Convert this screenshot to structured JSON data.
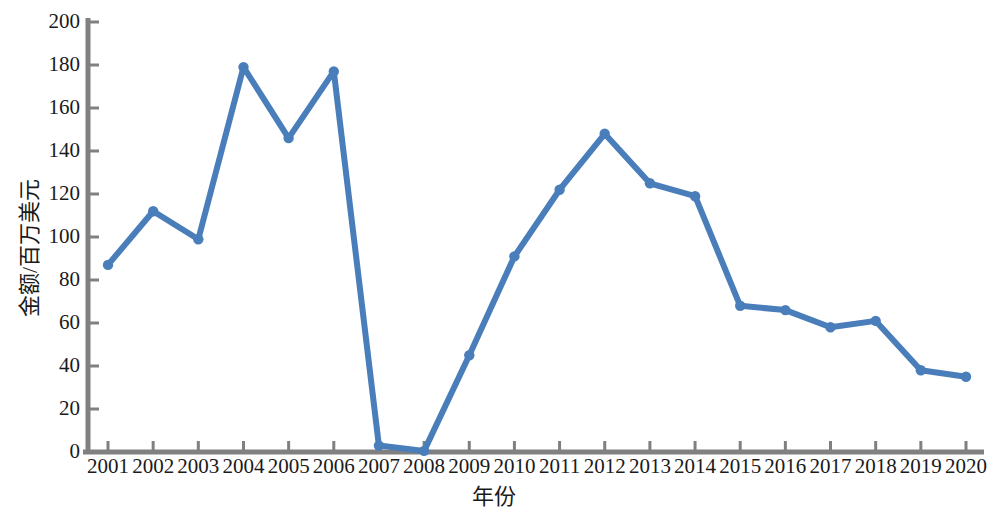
{
  "chart_data": {
    "type": "line",
    "title": "",
    "xlabel": "年份",
    "ylabel": "金额/百万美元",
    "categories": [
      "2001",
      "2002",
      "2003",
      "2004",
      "2005",
      "2006",
      "2007",
      "2008",
      "2009",
      "2010",
      "2011",
      "2012",
      "2013",
      "2014",
      "2015",
      "2016",
      "2017",
      "2018",
      "2019",
      "2020"
    ],
    "values": [
      87,
      112,
      99,
      179,
      146,
      177,
      3,
      0.5,
      45,
      91,
      122,
      148,
      125,
      119,
      68,
      66,
      58,
      61,
      38,
      35
    ],
    "series": [
      {
        "name": "金额/百万美元",
        "values": [
          87,
          112,
          99,
          179,
          146,
          177,
          3,
          0.5,
          45,
          91,
          122,
          148,
          125,
          119,
          68,
          66,
          58,
          61,
          38,
          35
        ]
      }
    ],
    "ylim": [
      0,
      200
    ],
    "yticks": [
      0,
      20,
      40,
      60,
      80,
      100,
      120,
      140,
      160,
      180,
      200
    ],
    "ytick_labels": [
      "0",
      "20",
      "40",
      "60",
      "80",
      "100",
      "120",
      "140",
      "160",
      "180",
      "200"
    ],
    "xtick_labels": [
      "2001",
      "2002",
      "2003",
      "2004",
      "2005",
      "2006",
      "2007",
      "2008",
      "2009",
      "2010",
      "2011",
      "2012",
      "2013",
      "2014",
      "2015",
      "2016",
      "2017",
      "2018",
      "2019",
      "2020"
    ],
    "grid": false,
    "legend": false,
    "legend_position": "none",
    "line_color": "#4a7ebb",
    "marker_color": "#4a7ebb",
    "axis_color": "#808080",
    "marker": "circle",
    "annotations": []
  }
}
